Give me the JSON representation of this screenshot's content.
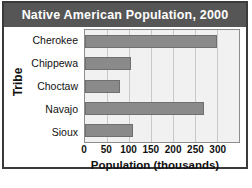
{
  "chart_data": {
    "type": "bar",
    "orientation": "horizontal",
    "title": "Native American Population, 2000",
    "xlabel": "Population (thousands)",
    "ylabel": "Tribe",
    "categories": [
      "Cherokee",
      "Chippewa",
      "Choctaw",
      "Navajo",
      "Sioux"
    ],
    "values": [
      300,
      105,
      80,
      270,
      108
    ],
    "xticks": [
      0,
      50,
      100,
      150,
      200,
      250,
      300
    ],
    "xlim": [
      0,
      350
    ],
    "grid": true,
    "legend": null,
    "colors": {
      "title_band": "#565656",
      "title_text": "#ffffff",
      "bar": "#8a8a8a",
      "bar_border": "#6f6f6f",
      "plot_background": "#f1f1f1",
      "gridline": "#c9c9c9",
      "frame": "#3a3a3a",
      "page_background": "#ffffff"
    }
  }
}
